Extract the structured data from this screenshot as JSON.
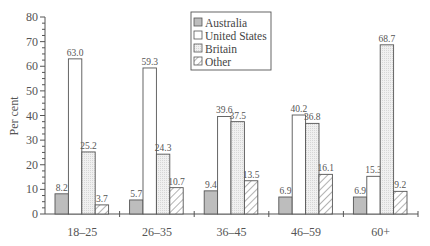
{
  "chart_data": {
    "type": "bar",
    "title": "",
    "xlabel": "",
    "ylabel": "Per cent",
    "ylim": [
      0,
      80
    ],
    "yticks": [
      0,
      10,
      20,
      30,
      40,
      50,
      60,
      70,
      80
    ],
    "grid": false,
    "legend_position": "top-center",
    "categories": [
      "18–25",
      "26–35",
      "36–45",
      "46–59",
      "60+"
    ],
    "series": [
      {
        "name": "Australia",
        "values": [
          8.2,
          5.7,
          9.4,
          6.9,
          6.9
        ],
        "fill": "#bdbdbd",
        "pattern": "solid-dark"
      },
      {
        "name": "United States",
        "values": [
          63.0,
          59.3,
          39.6,
          40.2,
          15.3
        ],
        "fill": "#ffffff",
        "pattern": "white"
      },
      {
        "name": "Britain",
        "values": [
          25.2,
          24.3,
          37.5,
          36.8,
          68.7
        ],
        "fill": "#ececec",
        "pattern": "light-dotted"
      },
      {
        "name": "Other",
        "values": [
          3.7,
          10.7,
          13.5,
          16.1,
          9.2
        ],
        "fill": "#ffffff",
        "pattern": "diagonal-hatch"
      }
    ],
    "value_labels": [
      [
        "8.2",
        "63.0",
        "25.2",
        "3.7"
      ],
      [
        "5.7",
        "59.3",
        "24.3",
        "10.7"
      ],
      [
        "9.4",
        "39.6",
        "37.5",
        "13.5"
      ],
      [
        "6.9",
        "40.2",
        "36.8",
        "16.1"
      ],
      [
        "6.9",
        "15.3",
        "68.7",
        "9.2"
      ]
    ]
  },
  "labels": {
    "ylabel": "Per cent",
    "legend": [
      "Australia",
      "United States",
      "Britain",
      "Other"
    ]
  }
}
